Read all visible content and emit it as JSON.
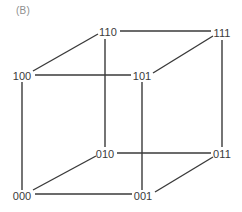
{
  "figure": {
    "panel_label": "(B)",
    "caption": "",
    "width": 242,
    "height": 212,
    "background_color": "#ffffff",
    "edge_color": "#3a3a3a",
    "label_color": "#3a3a3a",
    "panel_label_color": "#8e8e8e"
  },
  "chart_data": {
    "type": "diagram",
    "title": "(B)",
    "subtype": "3-cube graph (binary hypercube Q3)",
    "xlabel": "",
    "ylabel": "",
    "grid": false,
    "legend": null,
    "nodes": [
      {
        "id": "110",
        "label": "110",
        "x": 108,
        "y": 32,
        "anchor_x": 105,
        "anchor_y": 39
      },
      {
        "id": "111",
        "label": "111",
        "x": 222,
        "y": 33,
        "anchor_x": 222,
        "anchor_y": 40
      },
      {
        "id": "100",
        "label": "100",
        "x": 22,
        "y": 76,
        "anchor_x": 22,
        "anchor_y": 82
      },
      {
        "id": "101",
        "label": "101",
        "x": 142,
        "y": 76,
        "anchor_x": 142,
        "anchor_y": 82
      },
      {
        "id": "010",
        "label": "010",
        "x": 105,
        "y": 154,
        "anchor_x": 105,
        "anchor_y": 148
      },
      {
        "id": "011",
        "label": "011",
        "x": 222,
        "y": 154,
        "anchor_x": 222,
        "anchor_y": 148
      },
      {
        "id": "000",
        "label": "000",
        "x": 22,
        "y": 196,
        "anchor_x": 22,
        "anchor_y": 190
      },
      {
        "id": "001",
        "label": "001",
        "x": 143,
        "y": 196,
        "anchor_x": 143,
        "anchor_y": 190
      }
    ],
    "edges": [
      {
        "from": "100",
        "to": "000",
        "kind": "vertical",
        "x1": 22,
        "y1": 82,
        "x2": 22,
        "y2": 190
      },
      {
        "from": "110",
        "to": "010",
        "kind": "vertical",
        "x1": 105,
        "y1": 39,
        "x2": 105,
        "y2": 147
      },
      {
        "from": "101",
        "to": "001",
        "kind": "vertical",
        "x1": 142,
        "y1": 82,
        "x2": 142,
        "y2": 190
      },
      {
        "from": "111",
        "to": "011",
        "kind": "vertical",
        "x1": 222,
        "y1": 40,
        "x2": 222,
        "y2": 147
      },
      {
        "from": "100",
        "to": "101",
        "kind": "horizontal",
        "x1": 35,
        "y1": 75,
        "x2": 131,
        "y2": 75
      },
      {
        "from": "110",
        "to": "111",
        "kind": "horizontal",
        "x1": 120,
        "y1": 31,
        "x2": 211,
        "y2": 31
      },
      {
        "from": "010",
        "to": "011",
        "kind": "horizontal",
        "x1": 117,
        "y1": 153,
        "x2": 211,
        "y2": 153
      },
      {
        "from": "000",
        "to": "001",
        "kind": "horizontal",
        "x1": 35,
        "y1": 194,
        "x2": 132,
        "y2": 194
      },
      {
        "from": "100",
        "to": "110",
        "kind": "diagonal",
        "x1": 33,
        "y1": 71,
        "x2": 98,
        "y2": 34
      },
      {
        "from": "101",
        "to": "111",
        "kind": "diagonal",
        "x1": 153,
        "y1": 73,
        "x2": 213,
        "y2": 36
      },
      {
        "from": "000",
        "to": "010",
        "kind": "diagonal",
        "x1": 33,
        "y1": 190,
        "x2": 96,
        "y2": 156
      },
      {
        "from": "001",
        "to": "011",
        "kind": "diagonal",
        "x1": 155,
        "y1": 192,
        "x2": 213,
        "y2": 157
      }
    ]
  }
}
